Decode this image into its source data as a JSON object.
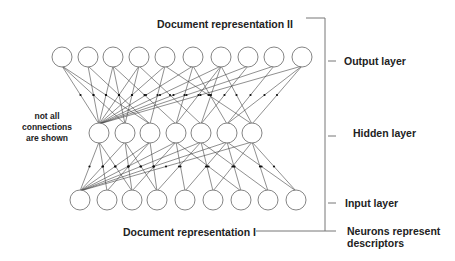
{
  "title_top": "Document representation II",
  "title_bottom": "Document representation I",
  "note": [
    "not all",
    "connections",
    "are shown"
  ],
  "layer_labels": {
    "output": "Output layer",
    "hidden": "Hidden layer",
    "input": "Input layer",
    "descriptors_line1": "Neurons represent",
    "descriptors_line2": "descriptors"
  },
  "layers": {
    "output": {
      "y": 57,
      "r": 10,
      "x": [
        62,
        88,
        113,
        139,
        165,
        193,
        221,
        248,
        274,
        302
      ]
    },
    "hidden": {
      "y": 133,
      "r": 10,
      "x": [
        99,
        125,
        150,
        176,
        201,
        227,
        252
      ]
    },
    "input": {
      "y": 200,
      "r": 10,
      "x": [
        80,
        107,
        132,
        157,
        185,
        213,
        241,
        268,
        296
      ]
    }
  },
  "connections_hidden_output": [
    [
      0,
      0
    ],
    [
      0,
      1
    ],
    [
      0,
      2
    ],
    [
      0,
      3
    ],
    [
      0,
      4
    ],
    [
      0,
      5
    ],
    [
      0,
      6
    ],
    [
      0,
      7
    ],
    [
      0,
      8
    ],
    [
      0,
      9
    ],
    [
      1,
      0
    ],
    [
      1,
      3
    ],
    [
      2,
      1
    ],
    [
      2,
      4
    ],
    [
      3,
      2
    ],
    [
      3,
      5
    ],
    [
      4,
      3
    ],
    [
      4,
      6
    ],
    [
      5,
      5
    ],
    [
      5,
      8
    ],
    [
      6,
      6
    ],
    [
      6,
      9
    ],
    [
      1,
      2
    ],
    [
      2,
      0
    ],
    [
      3,
      6
    ],
    [
      4,
      7
    ],
    [
      5,
      9
    ],
    [
      6,
      4
    ]
  ],
  "connections_input_hidden": [
    [
      0,
      0
    ],
    [
      0,
      1
    ],
    [
      0,
      2
    ],
    [
      0,
      3
    ],
    [
      0,
      4
    ],
    [
      0,
      5
    ],
    [
      0,
      6
    ],
    [
      1,
      0
    ],
    [
      1,
      2
    ],
    [
      2,
      1
    ],
    [
      2,
      3
    ],
    [
      3,
      2
    ],
    [
      3,
      4
    ],
    [
      4,
      3
    ],
    [
      4,
      5
    ],
    [
      5,
      4
    ],
    [
      5,
      6
    ],
    [
      6,
      5
    ],
    [
      7,
      6
    ],
    [
      8,
      6
    ],
    [
      2,
      0
    ],
    [
      3,
      1
    ],
    [
      6,
      3
    ],
    [
      7,
      4
    ],
    [
      8,
      5
    ]
  ],
  "colors": {
    "node_stroke": "#777777",
    "line": "#444444",
    "text": "#222222"
  }
}
